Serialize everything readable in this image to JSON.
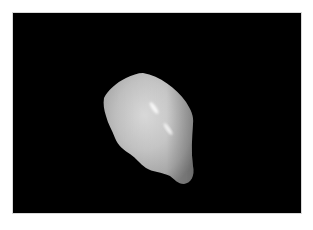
{
  "image": {
    "subject": "white specimen on black background",
    "background_color": "#000000",
    "border_color": "#ffffff",
    "specimen_base_color": "#bdbdbd",
    "specimen_highlight_color": "#f4f4f4",
    "specimen_shadow_color": "#7a7a7a"
  }
}
